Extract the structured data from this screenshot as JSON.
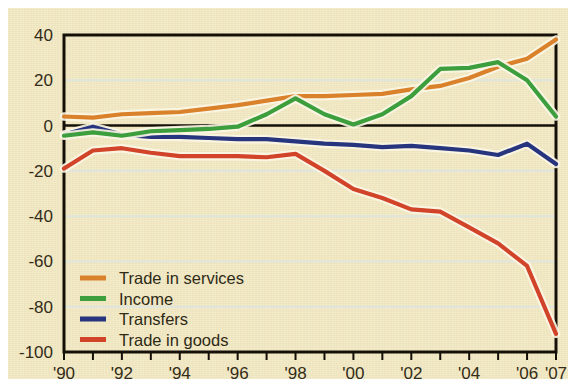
{
  "figure": {
    "background_color": "#f3e9c3",
    "frame_color": "#141008",
    "zero_line_color": "#141008",
    "gridline_color": "#d9e6e8"
  },
  "chart_data": {
    "type": "line",
    "title": "",
    "subtitle": "",
    "xlabel": "",
    "ylabel": "",
    "xlim": [
      1990,
      2007
    ],
    "ylim": [
      -100,
      40
    ],
    "yticks": [
      40,
      20,
      0,
      -20,
      -40,
      -60,
      -80,
      -100
    ],
    "ytick_labels": [
      "40",
      "20",
      "0",
      "-20",
      "-40",
      "-60",
      "-80",
      "-100"
    ],
    "x": [
      1990,
      1991,
      1992,
      1993,
      1994,
      1995,
      1996,
      1997,
      1998,
      1999,
      2000,
      2001,
      2002,
      2003,
      2004,
      2005,
      2006,
      2007
    ],
    "xtick_years": [
      1990,
      1991,
      1992,
      1993,
      1994,
      1995,
      1996,
      1997,
      1998,
      1999,
      2000,
      2001,
      2002,
      2003,
      2004,
      2005,
      2006,
      2007
    ],
    "xtick_labels": [
      "'90",
      "",
      "'92",
      "",
      "'94",
      "",
      "'96",
      "",
      "'98",
      "",
      "'00",
      "",
      "'02",
      "",
      "'04",
      "",
      "'06",
      "'07"
    ],
    "grid": "horizontal",
    "legend_position": "lower-left-inside",
    "series": [
      {
        "name": "Trade in services",
        "color": "#d9822b",
        "values": [
          4,
          3.5,
          5,
          5.5,
          6,
          7.5,
          9,
          11,
          13,
          13,
          13.5,
          14,
          16,
          17.5,
          21,
          26,
          29.5,
          38
        ]
      },
      {
        "name": "Income",
        "color": "#3c9e3c",
        "values": [
          -4.5,
          -3,
          -4.5,
          -2.5,
          -2,
          -1.5,
          -0.5,
          5,
          12,
          5,
          0.5,
          5,
          13,
          25,
          25.5,
          28,
          20,
          4
        ]
      },
      {
        "name": "Transfers",
        "color": "#27357e",
        "values": [
          -4,
          -0.5,
          -4,
          -5,
          -5,
          -5.5,
          -6,
          -6,
          -7,
          -8,
          -8.5,
          -9.5,
          -9,
          -10,
          -11,
          -13,
          -8,
          -17
        ]
      },
      {
        "name": "Trade in goods",
        "color": "#d1442a",
        "values": [
          -19,
          -11,
          -10,
          -12,
          -13.5,
          -13.5,
          -13.5,
          -14,
          -12.5,
          -20,
          -28,
          -32,
          -37,
          -38,
          -45,
          -52,
          -62,
          -92
        ]
      }
    ]
  },
  "legend": {
    "entries": [
      {
        "label": "Trade in services",
        "color": "#d9822b"
      },
      {
        "label": "Income",
        "color": "#3c9e3c"
      },
      {
        "label": "Transfers",
        "color": "#27357e"
      },
      {
        "label": "Trade in goods",
        "color": "#d1442a"
      }
    ]
  }
}
